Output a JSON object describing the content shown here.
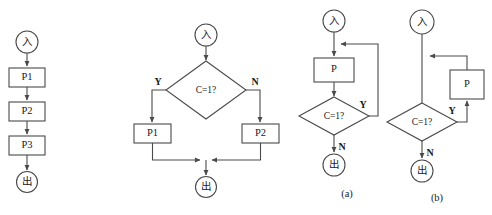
{
  "figure": {
    "title": "",
    "background_color": "#ffffff",
    "line_color": "#4a4a4a",
    "text_color": "#1a1a1a"
  },
  "glyphs": {
    "start": "入",
    "end": "出",
    "branch_yes": "Y",
    "branch_no": "N"
  },
  "diagrams": [
    {
      "id": "sequence",
      "caption": "",
      "kind": "sequence",
      "nodes": {
        "start": "入",
        "p1": "P1",
        "p2": "P2",
        "p3": "P3",
        "end": "出"
      }
    },
    {
      "id": "selection",
      "caption": "",
      "kind": "if-then-else",
      "nodes": {
        "start": "入",
        "condition": "C=1?",
        "yes_label": "Y",
        "no_label": "N",
        "p1": "P1",
        "p2": "P2",
        "end": "出"
      }
    },
    {
      "id": "do-while",
      "caption": "(a)",
      "kind": "do-while-loop",
      "nodes": {
        "start": "入",
        "process": "P",
        "condition": "C=1?",
        "loop_label": "Y",
        "exit_label": "N",
        "end": "出"
      }
    },
    {
      "id": "while-do",
      "caption": "(b)",
      "kind": "while-do-loop",
      "nodes": {
        "start": "入",
        "condition": "C=1?",
        "loop_label": "Y",
        "exit_label": "N",
        "process": "P",
        "end": "出"
      }
    }
  ]
}
